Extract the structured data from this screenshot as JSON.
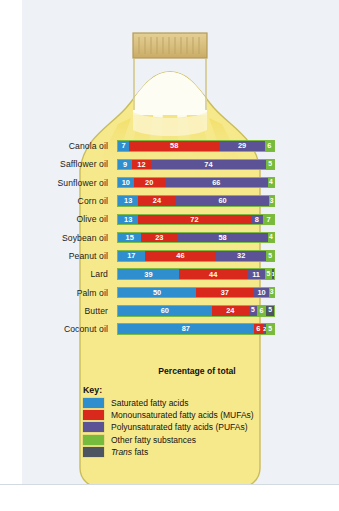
{
  "figure": {
    "illustration": "oil-bottle",
    "cap_label": "ribbed-cap"
  },
  "axis_caption": "Percentage of total",
  "legend": {
    "title": "Key:",
    "items": [
      {
        "key": "sat",
        "label": "Saturated fatty acids",
        "color": "#2f8fce",
        "italic": false
      },
      {
        "key": "mufa",
        "label": "Monounsaturated fatty acids (MUFAs)",
        "color": "#d8291c",
        "italic": false
      },
      {
        "key": "pufa",
        "label": "Polyunsaturated fatty acids (PUFAs)",
        "color": "#5b5396",
        "italic": false
      },
      {
        "key": "other",
        "label": "Other fatty substances",
        "color": "#76bb3c",
        "italic": false
      },
      {
        "key": "trans",
        "label": "Trans fats",
        "color": "#4d5560",
        "italic": true
      }
    ]
  },
  "colors": {
    "saturated": "#2f8fce",
    "monounsaturated": "#d8291c",
    "polyunsaturated": "#5b5396",
    "other": "#76bb3c",
    "trans": "#4d5560",
    "bottle_body": "#f6e98b",
    "bottle_outline": "#cbbf5e",
    "bar_outline": "#7dba3f",
    "page_background": "#eef1f5"
  },
  "chart_data": {
    "type": "bar",
    "orientation": "horizontal",
    "stacked": true,
    "title": "",
    "xlabel": "Percentage of total",
    "ylabel": "",
    "xlim": [
      0,
      100
    ],
    "grid": false,
    "legend_position": "bottom",
    "categories": [
      "Canola oil",
      "Safflower oil",
      "Sunflower oil",
      "Corn oil",
      "Olive oil",
      "Soybean oil",
      "Peanut oil",
      "Lard",
      "Palm oil",
      "Butter",
      "Coconut oil"
    ],
    "series": [
      {
        "name": "Saturated fatty acids",
        "key": "sat",
        "color": "#2f8fce",
        "values": [
          7,
          9,
          10,
          13,
          13,
          15,
          17,
          39,
          50,
          60,
          87
        ]
      },
      {
        "name": "Monounsaturated fatty acids (MUFAs)",
        "key": "mufa",
        "color": "#d8291c",
        "values": [
          58,
          12,
          20,
          24,
          72,
          23,
          46,
          44,
          37,
          24,
          6
        ]
      },
      {
        "name": "Polyunsaturated fatty acids (PUFAs)",
        "key": "pufa",
        "color": "#5b5396",
        "values": [
          29,
          74,
          66,
          60,
          8,
          58,
          32,
          11,
          10,
          5,
          2
        ]
      },
      {
        "name": "Other fatty substances",
        "key": "other",
        "color": "#76bb3c",
        "values": [
          6,
          5,
          4,
          3,
          7,
          4,
          5,
          5,
          3,
          6,
          5
        ]
      },
      {
        "name": "Trans fats",
        "key": "trans",
        "color": "#4d5560",
        "values": [
          0,
          0,
          0,
          0,
          0,
          0,
          0,
          1,
          0,
          5,
          0
        ]
      }
    ],
    "rows": [
      {
        "label": "Canola oil",
        "segments": [
          {
            "key": "sat",
            "value": 7
          },
          {
            "key": "mufa",
            "value": 58
          },
          {
            "key": "pufa",
            "value": 29
          },
          {
            "key": "other",
            "value": 6
          }
        ]
      },
      {
        "label": "Safflower oil",
        "segments": [
          {
            "key": "sat",
            "value": 9
          },
          {
            "key": "mufa",
            "value": 12
          },
          {
            "key": "pufa",
            "value": 74
          },
          {
            "key": "other",
            "value": 5
          }
        ]
      },
      {
        "label": "Sunflower oil",
        "segments": [
          {
            "key": "sat",
            "value": 10
          },
          {
            "key": "mufa",
            "value": 20
          },
          {
            "key": "pufa",
            "value": 66
          },
          {
            "key": "other",
            "value": 4
          }
        ]
      },
      {
        "label": "Corn oil",
        "segments": [
          {
            "key": "sat",
            "value": 13
          },
          {
            "key": "mufa",
            "value": 24
          },
          {
            "key": "pufa",
            "value": 60
          },
          {
            "key": "other",
            "value": 3
          }
        ]
      },
      {
        "label": "Olive oil",
        "segments": [
          {
            "key": "sat",
            "value": 13
          },
          {
            "key": "mufa",
            "value": 72
          },
          {
            "key": "pufa",
            "value": 8
          },
          {
            "key": "other",
            "value": 7
          }
        ]
      },
      {
        "label": "Soybean oil",
        "segments": [
          {
            "key": "sat",
            "value": 15
          },
          {
            "key": "mufa",
            "value": 23
          },
          {
            "key": "pufa",
            "value": 58
          },
          {
            "key": "other",
            "value": 4
          }
        ]
      },
      {
        "label": "Peanut oil",
        "segments": [
          {
            "key": "sat",
            "value": 17
          },
          {
            "key": "mufa",
            "value": 46
          },
          {
            "key": "pufa",
            "value": 32
          },
          {
            "key": "other",
            "value": 5
          }
        ]
      },
      {
        "label": "Lard",
        "segments": [
          {
            "key": "sat",
            "value": 39
          },
          {
            "key": "mufa",
            "value": 44
          },
          {
            "key": "pufa",
            "value": 11
          },
          {
            "key": "other",
            "value": 5
          },
          {
            "key": "trans",
            "value": 1
          }
        ]
      },
      {
        "label": "Palm oil",
        "segments": [
          {
            "key": "sat",
            "value": 50
          },
          {
            "key": "mufa",
            "value": 37
          },
          {
            "key": "pufa",
            "value": 10
          },
          {
            "key": "other",
            "value": 3
          }
        ]
      },
      {
        "label": "Butter",
        "segments": [
          {
            "key": "sat",
            "value": 60
          },
          {
            "key": "mufa",
            "value": 24
          },
          {
            "key": "pufa",
            "value": 5
          },
          {
            "key": "other",
            "value": 6
          },
          {
            "key": "trans",
            "value": 5
          }
        ]
      },
      {
        "label": "Coconut oil",
        "segments": [
          {
            "key": "sat",
            "value": 87
          },
          {
            "key": "mufa",
            "value": 6
          },
          {
            "key": "pufa",
            "value": 2
          },
          {
            "key": "other",
            "value": 5
          }
        ]
      }
    ]
  }
}
